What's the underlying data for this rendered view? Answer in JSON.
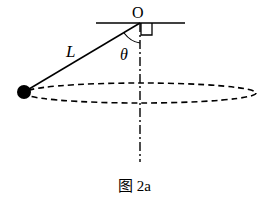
{
  "diagram": {
    "labels": {
      "pivot": "O",
      "length": "L",
      "angle": "θ"
    },
    "caption": "图 2a",
    "colors": {
      "stroke": "#000000",
      "background": "#ffffff"
    }
  }
}
